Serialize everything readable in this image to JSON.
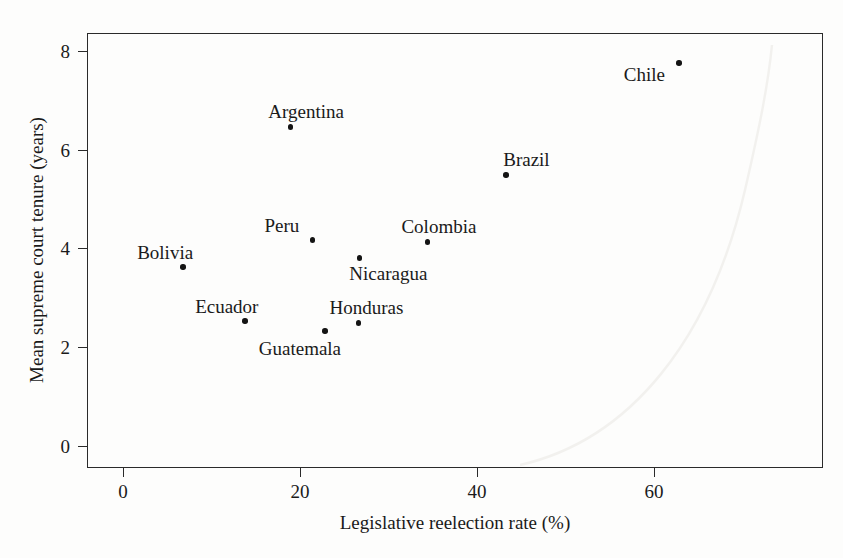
{
  "chart_data": {
    "type": "scatter",
    "title": "",
    "xlabel": "Legislative reelection rate (%)",
    "ylabel": "Mean supreme court tenure (years)",
    "xlim": [
      -4,
      79
    ],
    "ylim": [
      -0.45,
      8.35
    ],
    "xticks": [
      0,
      20,
      40,
      60
    ],
    "xticklabels": [
      "0",
      "20",
      "40",
      "60"
    ],
    "yticks": [
      0,
      2,
      4,
      6,
      8
    ],
    "yticklabels": [
      "0",
      "2",
      "4",
      "6",
      "8"
    ],
    "grid": false,
    "legend": false,
    "marker_color": "#141414",
    "axis_color": "#2a2a2a",
    "points": [
      {
        "label": "Bolivia",
        "x": 6.8,
        "y": 3.62,
        "label_dx": -46,
        "label_dy": -24
      },
      {
        "label": "Ecuador",
        "x": 13.8,
        "y": 2.53,
        "label_dx": -50,
        "label_dy": -24
      },
      {
        "label": "Argentina",
        "x": 18.9,
        "y": 6.46,
        "label_dx": -22,
        "label_dy": -25
      },
      {
        "label": "Peru",
        "x": 21.4,
        "y": 4.17,
        "label_dx": -48,
        "label_dy": -24
      },
      {
        "label": "Guatemala",
        "x": 22.8,
        "y": 2.33,
        "label_dx": -66,
        "label_dy": 8
      },
      {
        "label": "Honduras",
        "x": 26.6,
        "y": 2.49,
        "label_dx": -29,
        "label_dy": -25
      },
      {
        "label": "Nicaragua",
        "x": 26.7,
        "y": 3.81,
        "label_dx": -10,
        "label_dy": 6
      },
      {
        "label": "Colombia",
        "x": 34.4,
        "y": 4.13,
        "label_dx": -26,
        "label_dy": -25
      },
      {
        "label": "Brazil",
        "x": 43.3,
        "y": 5.49,
        "label_dx": -3,
        "label_dy": -25
      },
      {
        "label": "Chile",
        "x": 62.8,
        "y": 7.75,
        "label_dx": -55,
        "label_dy": 2
      }
    ]
  }
}
